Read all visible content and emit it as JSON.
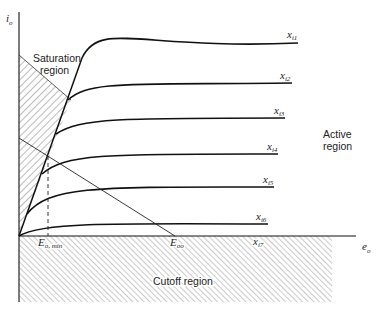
{
  "diagram": {
    "type": "transistor output characteristic curves",
    "axes": {
      "y_label": "i",
      "y_label_sub": "o",
      "x_label": "e",
      "x_label_sub": "o"
    },
    "regions": {
      "saturation": {
        "line1": "Saturation",
        "line2": "region"
      },
      "active": {
        "line1": "Active",
        "line2": "region"
      },
      "cutoff": {
        "label": "Cutoff region"
      }
    },
    "curves": [
      {
        "label": "x",
        "sub": "i1"
      },
      {
        "label": "x",
        "sub": "i2"
      },
      {
        "label": "x",
        "sub": "i3"
      },
      {
        "label": "x",
        "sub": "i4"
      },
      {
        "label": "x",
        "sub": "i5"
      },
      {
        "label": "x",
        "sub": "i6"
      },
      {
        "label": "x",
        "sub": "i7"
      }
    ],
    "markers": {
      "e_min": {
        "label": "E",
        "sub": "o, min"
      },
      "e_oo": {
        "label": "E",
        "sub": "oo"
      }
    },
    "colors": {
      "line": "#111111",
      "hatch": "#555555",
      "background": "#ffffff"
    }
  }
}
